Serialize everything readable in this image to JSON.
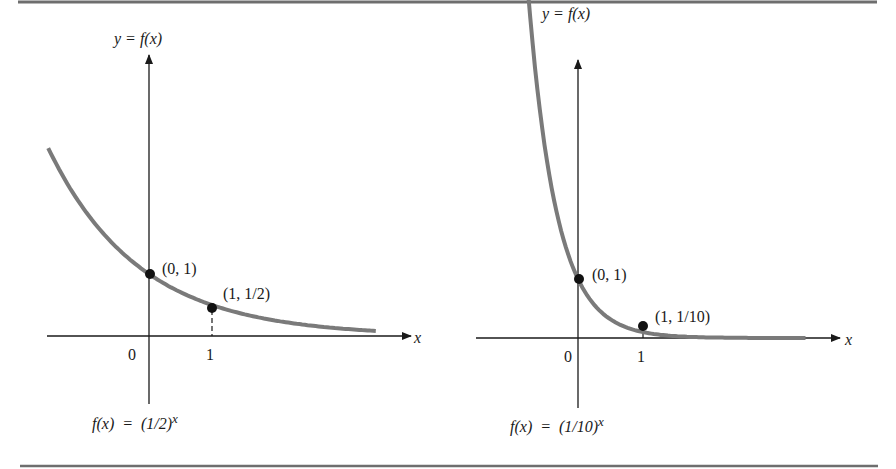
{
  "figure": {
    "rule_color": "#6e6e6e",
    "curve_color": "#7a7a7a",
    "axis_color": "#1a1a1a"
  },
  "chart_data": [
    {
      "type": "line",
      "title": "",
      "function_label": "f(x) = (1/2)^x",
      "function_label_base": "f(x)  =  (1/2)",
      "function_label_exp": "x",
      "ylabel": "y = f(x)",
      "xlabel": "x",
      "x_ticks": [
        "0",
        "1"
      ],
      "points": [
        {
          "x": 0,
          "y": 1,
          "label": "(0, 1)"
        },
        {
          "x": 1,
          "y": 0.5,
          "label": "(1, 1/2)"
        }
      ],
      "curve": {
        "base": 0.5,
        "x_range": [
          -1.6,
          3.6
        ]
      },
      "grid": false
    },
    {
      "type": "line",
      "title": "",
      "function_label": "f(x) = (1/10)^x",
      "function_label_base": "f(x)  =  (1/10)",
      "function_label_exp": "x",
      "ylabel": "y = f(x)",
      "xlabel": "x",
      "x_ticks": [
        "0",
        "1"
      ],
      "points": [
        {
          "x": 0,
          "y": 1,
          "label": "(0, 1)"
        },
        {
          "x": 1,
          "y": 0.1,
          "label": "(1, 1/10)"
        }
      ],
      "curve": {
        "base": 0.1,
        "x_range": [
          -0.88,
          3.5
        ]
      },
      "grid": false
    }
  ]
}
